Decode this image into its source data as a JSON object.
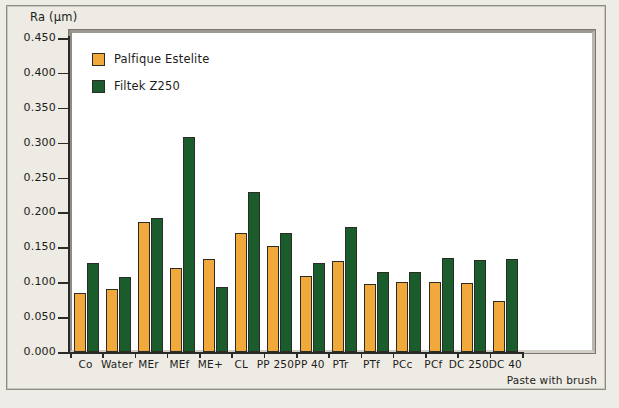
{
  "chart_data": {
    "type": "bar",
    "title": "",
    "ylabel": "Ra (μm)",
    "xlabel": "Paste with brush",
    "ylim": [
      0.0,
      0.45
    ],
    "ytick_labels": [
      "0.450",
      "0.400",
      "0.350",
      "0.300",
      "0.250",
      "0.200",
      "0.150",
      "0.100",
      "0.050",
      "0.000"
    ],
    "ytick_values": [
      0.45,
      0.4,
      0.35,
      0.3,
      0.25,
      0.2,
      0.15,
      0.1,
      0.05,
      0.0
    ],
    "grid": false,
    "legend_position": "top-left",
    "categories": [
      "Co",
      "Water",
      "MEr",
      "MEf",
      "ME+",
      "CL",
      "PP 250",
      "PP 40",
      "PTr",
      "PTf",
      "PCc",
      "PCf",
      "DC 250",
      "DC 40"
    ],
    "series": [
      {
        "name": "Palfique Estelite",
        "color": "#f0a93a",
        "values": [
          0.084,
          0.091,
          0.186,
          0.121,
          0.133,
          0.171,
          0.152,
          0.109,
          0.13,
          0.097,
          0.1,
          0.101,
          0.099,
          0.073
        ]
      },
      {
        "name": "Filtek Z250",
        "color": "#1b5c2d",
        "values": [
          0.127,
          0.107,
          0.192,
          0.308,
          0.093,
          0.23,
          0.171,
          0.128,
          0.179,
          0.114,
          0.114,
          0.135,
          0.132,
          0.133
        ]
      }
    ]
  },
  "axis": {
    "y_title": "Ra (μm)",
    "x_caption": "Paste with brush"
  }
}
